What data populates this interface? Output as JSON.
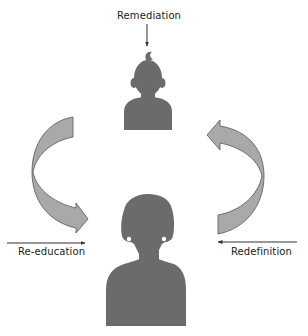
{
  "diagram": {
    "type": "cycle-diagram",
    "labels": {
      "top": "Remediation",
      "left": "Re-education",
      "right": "Redefinition"
    },
    "figures": {
      "child": "child-silhouette",
      "adult": "adult-silhouette"
    },
    "cycle_arrows": [
      "left-curved-arrow-down",
      "right-curved-arrow-up"
    ],
    "colors": {
      "silhouette": "#6b6b6b",
      "arrow_fill": "#a9a9a9",
      "arrow_stroke": "#555555",
      "line": "#333333",
      "text": "#222222",
      "background": "#ffffff"
    }
  }
}
